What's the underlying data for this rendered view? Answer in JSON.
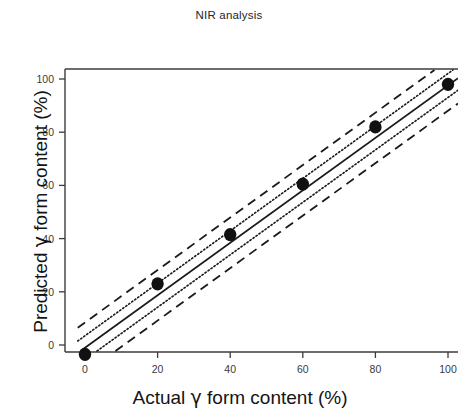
{
  "chart_data": {
    "type": "scatter",
    "title": "NIR analysis",
    "xlabel": "Actual γ form content (%)",
    "ylabel": "Predicted γ form content (%)",
    "xlim": [
      -5,
      105
    ],
    "ylim": [
      -8,
      107
    ],
    "xticks": [
      0,
      20,
      40,
      60,
      80,
      100
    ],
    "yticks": [
      0,
      20,
      40,
      60,
      80,
      100
    ],
    "xtick_labels": [
      "0",
      "20",
      "40",
      "60",
      "80",
      "100"
    ],
    "ytick_labels": [
      "0",
      "20",
      "40",
      "60",
      "80",
      "100"
    ],
    "grid": false,
    "legend": false,
    "legend_position": "none",
    "marker_color": "#111111",
    "line_color": "#1a1a1a",
    "series": [
      {
        "name": "Measured samples",
        "style": "scatter",
        "marker": "filled-circle",
        "x": [
          0,
          20,
          40,
          60,
          80,
          100
        ],
        "y": [
          -3.5,
          23,
          41.5,
          60.5,
          82,
          98
        ]
      },
      {
        "name": "Regression line",
        "style": "solid",
        "x": [
          -2,
          104
        ],
        "y": [
          -3.0,
          101.5
        ]
      },
      {
        "name": "Confidence interval upper",
        "style": "dotted",
        "x": [
          -2,
          104
        ],
        "y": [
          1.5,
          106.0
        ]
      },
      {
        "name": "Confidence interval lower",
        "style": "dotted",
        "x": [
          -2,
          104
        ],
        "y": [
          -7.5,
          97.0
        ]
      },
      {
        "name": "Prediction interval upper",
        "style": "dashed",
        "x": [
          -2,
          104
        ],
        "y": [
          6.5,
          111.0
        ]
      },
      {
        "name": "Prediction interval lower",
        "style": "dashed",
        "x": [
          -2,
          104
        ],
        "y": [
          -12.5,
          92.0
        ]
      }
    ]
  },
  "axes": {
    "x_title": "Actual γ form content (%)",
    "y_title": "Predicted γ form content (%)"
  },
  "header": {
    "title": "NIR analysis"
  }
}
